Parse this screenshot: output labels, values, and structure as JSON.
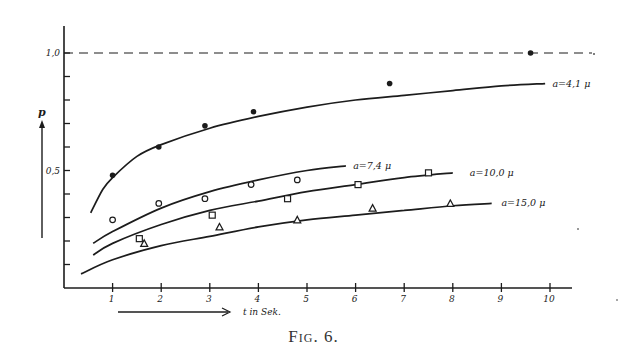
{
  "caption": "Fig. 6.",
  "chart_data": {
    "type": "line",
    "title": "",
    "xlabel": "t in Sek.",
    "ylabel": "p",
    "xlim": [
      0,
      10.5
    ],
    "ylim": [
      0,
      1.0
    ],
    "x_ticks": [
      1,
      2,
      3,
      4,
      5,
      6,
      7,
      8,
      9,
      10
    ],
    "y_tick_labels": [
      {
        "value": 1.0,
        "label": "1,0"
      },
      {
        "value": 0.5,
        "label": "0,5"
      }
    ],
    "y_minor_ticks": [
      0.1,
      0.2,
      0.3,
      0.4,
      0.5,
      0.6,
      0.7,
      0.8,
      0.9,
      1.0
    ],
    "reference_line": {
      "y": 1.0,
      "style": "dashed"
    },
    "grid": false,
    "series": [
      {
        "name": "a=4,1 μ",
        "marker": "filled-circle",
        "points": [
          [
            1.0,
            0.48
          ],
          [
            1.95,
            0.6
          ],
          [
            2.9,
            0.69
          ],
          [
            3.9,
            0.75
          ],
          [
            6.7,
            0.87
          ],
          [
            9.6,
            1.0
          ]
        ],
        "curve": [
          [
            0.55,
            0.32
          ],
          [
            0.8,
            0.42
          ],
          [
            1.0,
            0.47
          ],
          [
            1.5,
            0.56
          ],
          [
            2.0,
            0.61
          ],
          [
            3.0,
            0.68
          ],
          [
            4.0,
            0.73
          ],
          [
            5.0,
            0.77
          ],
          [
            6.0,
            0.8
          ],
          [
            7.0,
            0.82
          ],
          [
            8.0,
            0.84
          ],
          [
            9.0,
            0.86
          ],
          [
            9.9,
            0.87
          ]
        ]
      },
      {
        "name": "a=7,4 μ",
        "marker": "open-circle",
        "points": [
          [
            1.0,
            0.29
          ],
          [
            1.95,
            0.36
          ],
          [
            2.9,
            0.38
          ],
          [
            3.85,
            0.44
          ],
          [
            4.8,
            0.46
          ]
        ],
        "curve": [
          [
            0.6,
            0.19
          ],
          [
            1.0,
            0.24
          ],
          [
            2.0,
            0.34
          ],
          [
            3.0,
            0.41
          ],
          [
            4.0,
            0.46
          ],
          [
            5.0,
            0.5
          ],
          [
            5.8,
            0.52
          ]
        ]
      },
      {
        "name": "a=10,0 μ",
        "marker": "open-square",
        "points": [
          [
            1.55,
            0.21
          ],
          [
            3.05,
            0.31
          ],
          [
            4.6,
            0.38
          ],
          [
            6.05,
            0.44
          ],
          [
            7.5,
            0.49
          ]
        ],
        "curve": [
          [
            0.6,
            0.14
          ],
          [
            1.0,
            0.19
          ],
          [
            2.0,
            0.27
          ],
          [
            3.0,
            0.33
          ],
          [
            4.0,
            0.37
          ],
          [
            5.0,
            0.41
          ],
          [
            6.0,
            0.44
          ],
          [
            7.0,
            0.47
          ],
          [
            8.0,
            0.49
          ]
        ]
      },
      {
        "name": "a=15,0 μ",
        "marker": "open-triangle",
        "points": [
          [
            1.65,
            0.19
          ],
          [
            3.2,
            0.26
          ],
          [
            4.8,
            0.29
          ],
          [
            6.35,
            0.34
          ],
          [
            7.95,
            0.36
          ]
        ],
        "curve": [
          [
            0.35,
            0.06
          ],
          [
            1.0,
            0.12
          ],
          [
            2.0,
            0.18
          ],
          [
            3.0,
            0.22
          ],
          [
            4.0,
            0.26
          ],
          [
            5.0,
            0.29
          ],
          [
            6.0,
            0.31
          ],
          [
            7.0,
            0.33
          ],
          [
            8.0,
            0.35
          ],
          [
            8.8,
            0.36
          ]
        ]
      }
    ],
    "series_labels": [
      {
        "text": "a=4,1 μ",
        "x": 10.05,
        "y": 0.87
      },
      {
        "text": "a=7,4 μ",
        "x": 5.95,
        "y": 0.52
      },
      {
        "text": "a=10,0 μ",
        "x": 8.35,
        "y": 0.49
      },
      {
        "text": "a=15,0 μ",
        "x": 9.0,
        "y": 0.36
      }
    ]
  }
}
